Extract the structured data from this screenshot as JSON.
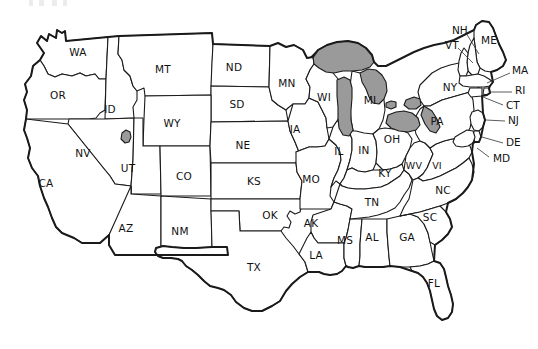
{
  "map": {
    "title": "United States state abbreviation map",
    "background_color": "#ffffff",
    "outline_color": "#1a1a1a",
    "water_color": "#9a9a9a",
    "label_color": "#111111",
    "water_features": [
      "Great Lakes",
      "Great Salt Lake"
    ],
    "inner_labels": [
      {
        "code": "WA",
        "x": 78,
        "y": 53
      },
      {
        "code": "OR",
        "x": 58,
        "y": 96
      },
      {
        "code": "ID",
        "x": 110,
        "y": 110
      },
      {
        "code": "MT",
        "x": 163,
        "y": 70
      },
      {
        "code": "ND",
        "x": 234,
        "y": 68
      },
      {
        "code": "SD",
        "x": 237,
        "y": 105
      },
      {
        "code": "WY",
        "x": 172,
        "y": 124
      },
      {
        "code": "NV",
        "x": 83,
        "y": 154
      },
      {
        "code": "UT",
        "x": 128,
        "y": 169
      },
      {
        "code": "CO",
        "x": 184,
        "y": 177
      },
      {
        "code": "NE",
        "x": 243,
        "y": 146
      },
      {
        "code": "KS",
        "x": 254,
        "y": 182
      },
      {
        "code": "CA",
        "x": 46,
        "y": 184
      },
      {
        "code": "AZ",
        "x": 126,
        "y": 229
      },
      {
        "code": "NM",
        "x": 180,
        "y": 232
      },
      {
        "code": "OK",
        "x": 270,
        "y": 216
      },
      {
        "code": "TX",
        "x": 254,
        "y": 268
      },
      {
        "code": "MN",
        "x": 287,
        "y": 84
      },
      {
        "code": "IA",
        "x": 295,
        "y": 130
      },
      {
        "code": "MO",
        "x": 311,
        "y": 180
      },
      {
        "code": "WI",
        "x": 324,
        "y": 98
      },
      {
        "code": "MI",
        "x": 370,
        "y": 101
      },
      {
        "code": "IL",
        "x": 339,
        "y": 152
      },
      {
        "code": "IN",
        "x": 364,
        "y": 151
      },
      {
        "code": "OH",
        "x": 392,
        "y": 140
      },
      {
        "code": "KY",
        "x": 385,
        "y": 174
      },
      {
        "code": "AK",
        "x": 311,
        "y": 224
      },
      {
        "code": "LA",
        "x": 316,
        "y": 256
      },
      {
        "code": "MS",
        "x": 345,
        "y": 241
      },
      {
        "code": "AL",
        "x": 372,
        "y": 238
      },
      {
        "code": "GA",
        "x": 407,
        "y": 238
      },
      {
        "code": "TN",
        "x": 372,
        "y": 203
      },
      {
        "code": "WV",
        "x": 414,
        "y": 166
      },
      {
        "code": "VI",
        "x": 437,
        "y": 166
      },
      {
        "code": "NC",
        "x": 443,
        "y": 191
      },
      {
        "code": "SC",
        "x": 430,
        "y": 218
      },
      {
        "code": "FL",
        "x": 434,
        "y": 284
      },
      {
        "code": "NY",
        "x": 450,
        "y": 88
      },
      {
        "code": "PA",
        "x": 437,
        "y": 122
      },
      {
        "code": "ME",
        "x": 489,
        "y": 41
      }
    ],
    "callout_labels": [
      {
        "code": "NH",
        "x": 452,
        "y": 31,
        "line": [
          466,
          33,
          479,
          54
        ]
      },
      {
        "code": "VT",
        "x": 445,
        "y": 46,
        "line": [
          458,
          48,
          473,
          63
        ]
      },
      {
        "code": "MA",
        "x": 512,
        "y": 71,
        "line": [
          510,
          73,
          487,
          83
        ]
      },
      {
        "code": "RI",
        "x": 515,
        "y": 91,
        "line": [
          512,
          92,
          489,
          92
        ]
      },
      {
        "code": "CT",
        "x": 506,
        "y": 106,
        "line": [
          503,
          105,
          483,
          97
        ]
      },
      {
        "code": "NJ",
        "x": 508,
        "y": 121,
        "line": [
          505,
          121,
          486,
          120
        ]
      },
      {
        "code": "DE",
        "x": 506,
        "y": 143,
        "line": [
          503,
          143,
          482,
          137
        ]
      },
      {
        "code": "MD",
        "x": 493,
        "y": 159,
        "line": [
          489,
          157,
          477,
          148
        ]
      }
    ]
  }
}
